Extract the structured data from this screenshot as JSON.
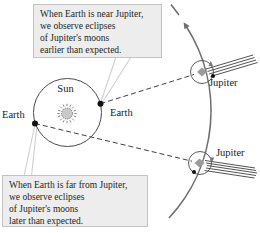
{
  "callout_top": {
    "lines": [
      "When Earth is near Jupiter,",
      "we observe eclipses",
      "of Jupiter's moons",
      "earlier than expected."
    ]
  },
  "callout_bottom": {
    "lines": [
      "When Earth is far from Jupiter,",
      "we observe eclipses",
      "of Jupiter's moons",
      "later than expected."
    ]
  },
  "labels": {
    "sun": "Sun",
    "earth_left": "Earth",
    "earth_right": "Earth",
    "jupiter_top": "Jupiter",
    "jupiter_bottom": "Jupiter"
  },
  "colors": {
    "background": "#ffffff",
    "callout_fill": "#ededed",
    "callout_border": "#c3c3c3",
    "text": "#1f1f1f",
    "diagram_line": "#3f3f3f",
    "orbit_arc": "#6f6f6f",
    "planet_gray": "#9b9b9b",
    "sun_gray": "#c9c9c9",
    "callout_pointer": "#cfcfcf"
  }
}
